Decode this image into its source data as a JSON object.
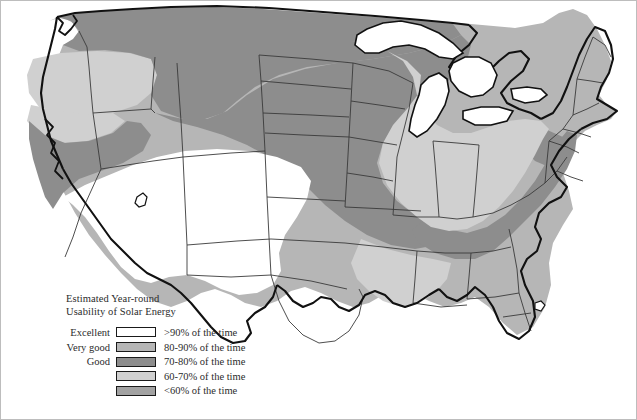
{
  "figure": {
    "type": "choropleth-map",
    "region": "Contiguous United States",
    "border_color": "#bdbdbd",
    "background": "#ffffff"
  },
  "legend": {
    "title_line1": "Estimated Year-round",
    "title_line2": "Usability of Solar Energy",
    "rows": [
      {
        "category": "Excellent",
        "description": ">90% of the time",
        "color": "#ffffff"
      },
      {
        "category": "Very good",
        "description": "80-90% of the time",
        "color": "#b6b6b6"
      },
      {
        "category": "Good",
        "description": "70-80% of the time",
        "color": "#8d8d8d"
      },
      {
        "category": "",
        "description": "60-70% of the time",
        "color": "#d0d0d0"
      },
      {
        "category": "",
        "description": "<60% of the time",
        "color": "#a2a2a2"
      }
    ]
  },
  "map_data": {
    "outline_color": "#111111",
    "state_line_color": "#333333",
    "zones": [
      {
        "name": "excellent-southwest",
        "label": "Excellent (>90% of the time)",
        "color": "#ffffff",
        "areas": [
          "southern California",
          "Arizona",
          "New Mexico",
          "west Texas"
        ]
      },
      {
        "name": "very-good-interior-west",
        "label": "Very good (80-90% of the time)",
        "color": "#b6b6b6",
        "areas": [
          "central California",
          "Nevada",
          "Utah",
          "Colorado",
          "Kansas",
          "Oklahoma",
          "Texas",
          "Gulf Coast",
          "Florida",
          "Georgia",
          "Carolinas",
          "New England"
        ]
      },
      {
        "name": "good-northern-tier",
        "label": "Good (70-80% of the time)",
        "color": "#8d8d8d",
        "areas": [
          "Washington",
          "Idaho",
          "Montana",
          "Wyoming",
          "Dakotas",
          "Nebraska",
          "Missouri",
          "Kentucky",
          "Tennessee",
          "West Virginia",
          "Virginia",
          "Pennsylvania",
          "northern coastal California",
          "Oregon coast"
        ]
      },
      {
        "name": "sixty-seventy-midwest",
        "label": "60-70% of the time",
        "color": "#d0d0d0",
        "areas": [
          "Oregon interior",
          "northern California valley",
          "Minnesota",
          "Iowa",
          "Wisconsin",
          "Illinois",
          "Indiana",
          "Ohio",
          "Michigan",
          "New York",
          "Arkansas",
          "Mississippi",
          "Alabama",
          "Louisiana"
        ]
      },
      {
        "name": "under-sixty",
        "label": "<60% of the time",
        "color": "#a2a2a2",
        "areas": [
          "scattered Appalachian and northern interior pockets"
        ]
      }
    ],
    "water_bodies": [
      "Lake Superior",
      "Lake Michigan",
      "Lake Huron",
      "Lake Erie",
      "Lake Ontario",
      "Great Salt Lake"
    ]
  }
}
